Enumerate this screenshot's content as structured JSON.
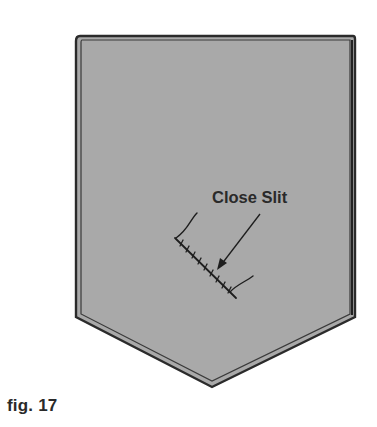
{
  "figure": {
    "caption": "fig. 17",
    "annotation": {
      "label": "Close Slit",
      "pointer": "arrow"
    },
    "colors": {
      "fill": "#a9a9a9",
      "outline": "#2b2b2b",
      "inner_line": "#3a3a3a",
      "background": "#ffffff",
      "text": "#2a2a2a"
    }
  }
}
